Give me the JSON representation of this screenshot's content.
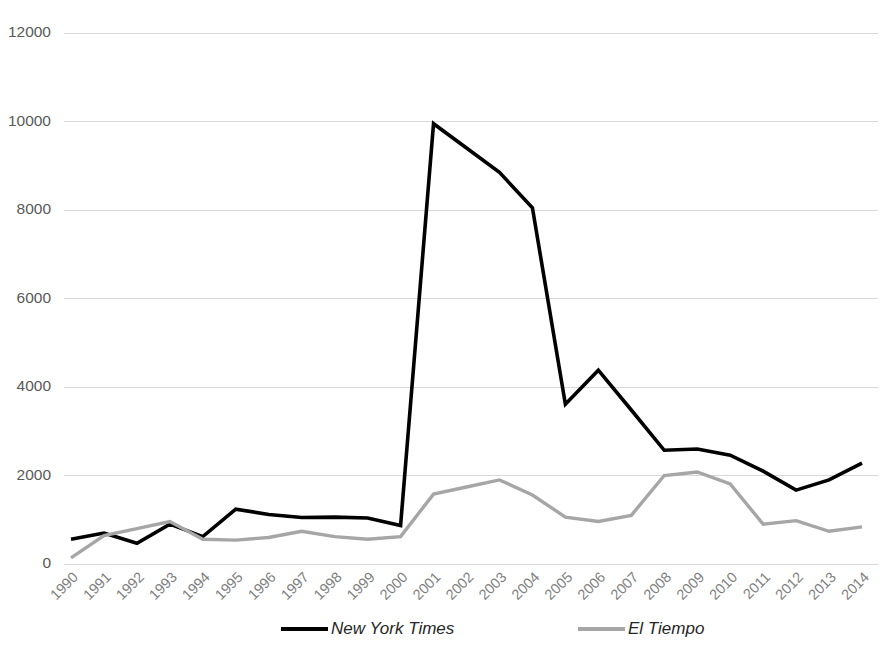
{
  "chart_data": {
    "type": "line",
    "title": "",
    "subtitle": "",
    "xlabel": "",
    "ylabel": "",
    "grid": true,
    "legend_position": "bottom",
    "xlim": [
      1990,
      2014
    ],
    "ylim": [
      0,
      12000
    ],
    "ytick_labels": [
      "0",
      "2000",
      "4000",
      "6000",
      "8000",
      "10000",
      "12000"
    ],
    "yticks": [
      0,
      2000,
      4000,
      6000,
      8000,
      10000,
      12000
    ],
    "categories": [
      "1990",
      "1991",
      "1992",
      "1993",
      "1994",
      "1995",
      "1996",
      "1997",
      "1998",
      "1999",
      "2000",
      "2001",
      "2002",
      "2003",
      "2004",
      "2005",
      "2006",
      "2007",
      "2008",
      "2009",
      "2010",
      "2011",
      "2012",
      "2013",
      "2014"
    ],
    "series": [
      {
        "name": "New York Times",
        "color": "#000000",
        "values": [
          560,
          700,
          470,
          900,
          620,
          1240,
          1120,
          1050,
          1060,
          1040,
          870,
          9950,
          9400,
          8850,
          8050,
          3610,
          4380,
          3480,
          2570,
          2600,
          2460,
          2100,
          1670,
          1900,
          2280
        ]
      },
      {
        "name": "El Tiempo",
        "color": "#a6a6a6",
        "values": [
          140,
          640,
          800,
          960,
          560,
          540,
          600,
          740,
          620,
          560,
          620,
          1580,
          1740,
          1900,
          1560,
          1060,
          960,
          1100,
          2000,
          2080,
          1810,
          900,
          980,
          740,
          840
        ]
      }
    ]
  },
  "legend": {
    "items": [
      {
        "label": "New York Times",
        "color": "#000000"
      },
      {
        "label": "El Tiempo",
        "color": "#a6a6a6"
      }
    ]
  }
}
